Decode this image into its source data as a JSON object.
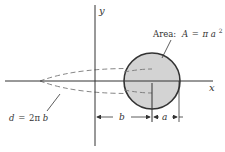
{
  "diagram": {
    "axes": {
      "x_label": "x",
      "y_label": "y"
    },
    "area_label": {
      "prefix": "Area:",
      "lhs": "A",
      "eq": "=",
      "pi": "π",
      "var": "a",
      "exp": "2"
    },
    "distance_label": {
      "lhs": "d",
      "eq": "=",
      "coef": "2π",
      "var": "b"
    },
    "dimensions": {
      "b_label": "b",
      "a_label": "a"
    },
    "colors": {
      "circle_fill": "#d3d3d3",
      "stroke": "#333333",
      "dashed": "#777777"
    }
  }
}
